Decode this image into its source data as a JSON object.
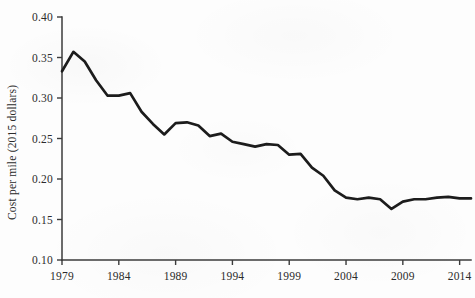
{
  "chart_data": {
    "type": "line",
    "title": "",
    "subtitle": "",
    "xlabel": "",
    "ylabel": "Cost per mile (2015 dollars)",
    "xlim": [
      1979,
      2015
    ],
    "ylim": [
      0.1,
      0.4
    ],
    "grid": false,
    "legend": null,
    "legend_position": "none",
    "y_ticks": [
      "0.40",
      "0.35",
      "0.30",
      "0.25",
      "0.20",
      "0.15",
      "0.10"
    ],
    "y_tick_values": [
      0.4,
      0.35,
      0.3,
      0.25,
      0.2,
      0.15,
      0.1
    ],
    "x_ticks": [
      "1979",
      "1984",
      "1989",
      "1994",
      "1999",
      "2004",
      "2009",
      "2014"
    ],
    "x_tick_values": [
      1979,
      1984,
      1989,
      1994,
      1999,
      2004,
      2009,
      2014
    ],
    "series": [
      {
        "name": "Cost per mile",
        "color": "#1c1c1c",
        "x": [
          1979,
          1980,
          1981,
          1982,
          1983,
          1984,
          1985,
          1986,
          1987,
          1988,
          1989,
          1990,
          1991,
          1992,
          1993,
          1994,
          1995,
          1996,
          1997,
          1998,
          1999,
          2000,
          2001,
          2002,
          2003,
          2004,
          2005,
          2006,
          2007,
          2008,
          2009,
          2010,
          2011,
          2012,
          2013,
          2014,
          2015
        ],
        "values": [
          0.333,
          0.357,
          0.345,
          0.322,
          0.303,
          0.303,
          0.306,
          0.283,
          0.268,
          0.255,
          0.269,
          0.27,
          0.266,
          0.253,
          0.256,
          0.246,
          0.243,
          0.24,
          0.243,
          0.242,
          0.23,
          0.231,
          0.214,
          0.204,
          0.186,
          0.177,
          0.175,
          0.177,
          0.175,
          0.163,
          0.172,
          0.175,
          0.175,
          0.177,
          0.178,
          0.176,
          0.176
        ]
      }
    ]
  },
  "axes_geometry": {
    "plot_left": 62,
    "plot_right": 471,
    "plot_top": 17,
    "plot_bottom": 260,
    "x_year_min": 1979,
    "x_year_max": 2015,
    "y_value_min": 0.1,
    "y_value_max": 0.4
  }
}
